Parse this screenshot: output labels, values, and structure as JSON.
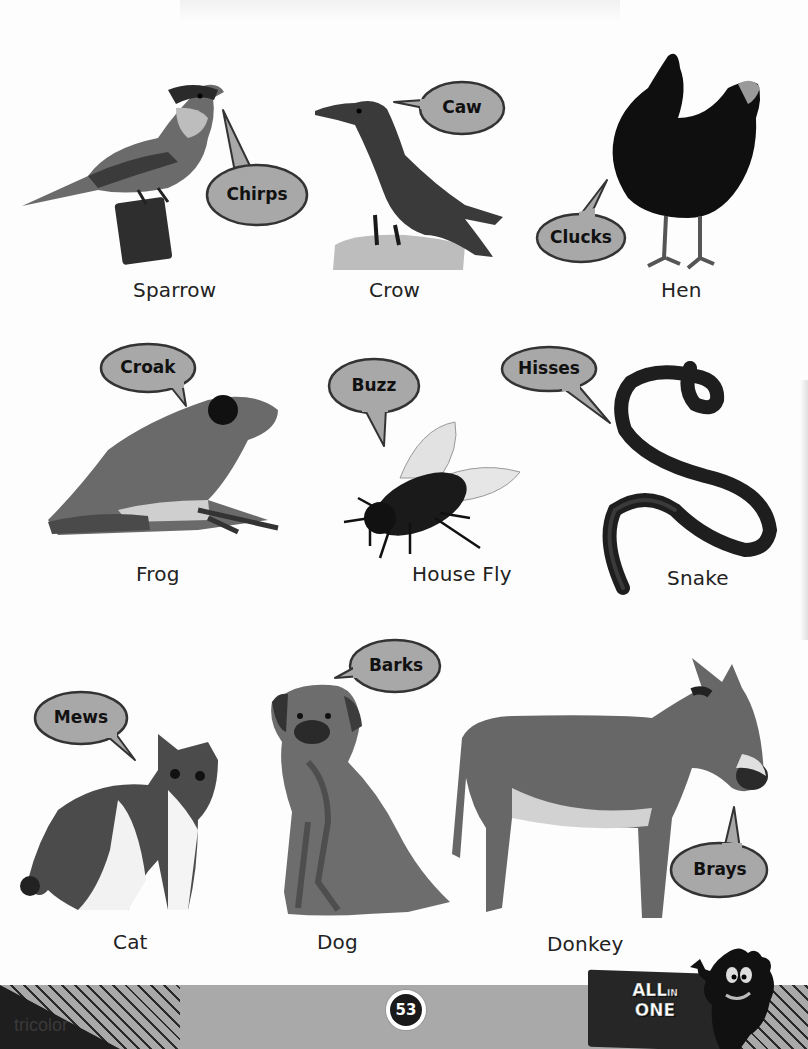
{
  "page": {
    "page_number": "53",
    "brand": "tricolor",
    "series_badge": {
      "line1": "ALL",
      "line1_small": "IN",
      "line2": "ONE"
    }
  },
  "colors": {
    "bubble_fill": "#a8a8a8",
    "bubble_stroke": "#333333",
    "footer_band": "#a9a9a9",
    "footer_dark": "#1e1e1e"
  },
  "animals": [
    {
      "name": "Sparrow",
      "sound": "Chirps",
      "icon": "sparrow-icon"
    },
    {
      "name": "Crow",
      "sound": "Caw",
      "icon": "crow-icon"
    },
    {
      "name": "Hen",
      "sound": "Clucks",
      "icon": "hen-icon"
    },
    {
      "name": "Frog",
      "sound": "Croak",
      "icon": "frog-icon"
    },
    {
      "name": "House Fly",
      "sound": "Buzz",
      "icon": "house-fly-icon"
    },
    {
      "name": "Snake",
      "sound": "Hisses",
      "icon": "snake-icon"
    },
    {
      "name": "Cat",
      "sound": "Mews",
      "icon": "cat-icon"
    },
    {
      "name": "Dog",
      "sound": "Barks",
      "icon": "dog-icon"
    },
    {
      "name": "Donkey",
      "sound": "Brays",
      "icon": "donkey-icon"
    }
  ]
}
